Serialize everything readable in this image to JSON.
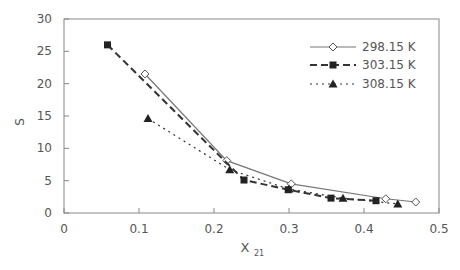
{
  "chart_data": {
    "type": "line",
    "title": "",
    "xlabel": "X",
    "xlabel_sub": "21",
    "ylabel": "S",
    "xlim": [
      0,
      0.5
    ],
    "ylim": [
      0,
      30
    ],
    "xticks": [
      "0",
      "0.1",
      "0.2",
      "0.3",
      "0.4",
      "0.5"
    ],
    "yticks": [
      "0",
      "5",
      "10",
      "15",
      "20",
      "25",
      "30"
    ],
    "grid": false,
    "legend_position": "upper right",
    "series": [
      {
        "name": "298.15 K",
        "marker": "open-diamond",
        "line": "solid",
        "x": [
          0.108,
          0.217,
          0.303,
          0.429,
          0.469
        ],
        "y": [
          21.5,
          8.1,
          4.5,
          2.2,
          1.7
        ]
      },
      {
        "name": "303.15 K",
        "marker": "filled-square",
        "line": "dashed",
        "x": [
          0.058,
          0.24,
          0.299,
          0.356,
          0.416
        ],
        "y": [
          26.0,
          5.1,
          3.6,
          2.3,
          1.9
        ]
      },
      {
        "name": "308.15 K",
        "marker": "filled-triangle",
        "line": "dotted",
        "x": [
          0.112,
          0.221,
          0.3,
          0.372,
          0.445
        ],
        "y": [
          14.6,
          6.7,
          3.7,
          2.3,
          1.4
        ]
      }
    ]
  }
}
